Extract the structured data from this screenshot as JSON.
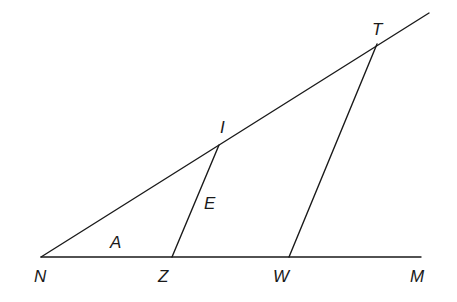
{
  "diagram": {
    "type": "geometry",
    "points": {
      "N": {
        "x": 41,
        "y": 257,
        "label": "N",
        "lx": 34,
        "ly": 282
      },
      "Z": {
        "x": 172,
        "y": 257,
        "label": "Z",
        "lx": 158,
        "ly": 282
      },
      "W": {
        "x": 289,
        "y": 257,
        "label": "W",
        "lx": 273,
        "ly": 282
      },
      "M": {
        "x": 421,
        "y": 257,
        "label": "M",
        "lx": 410,
        "ly": 282
      },
      "I": {
        "x": 219,
        "y": 145,
        "label": "I",
        "lx": 220,
        "ly": 133
      },
      "T": {
        "x": 377,
        "y": 44,
        "label": "T",
        "lx": 372,
        "ly": 35
      }
    },
    "interior_labels": [
      {
        "id": "A",
        "label": "A",
        "x": 110,
        "y": 248
      },
      {
        "id": "E",
        "label": "E",
        "x": 204,
        "y": 209
      }
    ],
    "segments": [
      {
        "id": "ray-NT",
        "from": "N",
        "x1": 41,
        "y1": 257,
        "x2": 429,
        "y2": 13
      },
      {
        "id": "line-NM",
        "from": "N",
        "to": "M",
        "x1": 41,
        "y1": 257,
        "x2": 421,
        "y2": 257
      },
      {
        "id": "seg-ZI",
        "from": "Z",
        "to": "I",
        "x1": 172,
        "y1": 257,
        "x2": 219,
        "y2": 145
      },
      {
        "id": "seg-WT",
        "from": "W",
        "to": "T",
        "x1": 289,
        "y1": 257,
        "x2": 377,
        "y2": 44
      }
    ]
  }
}
